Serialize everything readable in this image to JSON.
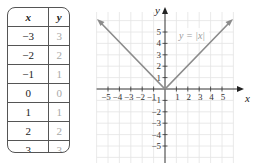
{
  "table": {
    "headers": [
      "x",
      "y"
    ],
    "rows": [
      {
        "x": "−3",
        "y": "3"
      },
      {
        "x": "−2",
        "y": "2"
      },
      {
        "x": "−1",
        "y": "1"
      },
      {
        "x": "0",
        "y": "0"
      },
      {
        "x": "1",
        "y": "1"
      },
      {
        "x": "2",
        "y": "2"
      },
      {
        "x": "3",
        "y": "3"
      }
    ]
  },
  "graph": {
    "function_label": "y = |x|",
    "x_axis_label": "x",
    "y_axis_label": "y",
    "x_ticks": [
      "−5",
      "−4",
      "−3",
      "−2",
      "−1",
      "1",
      "2",
      "3",
      "4",
      "5"
    ],
    "y_ticks": [
      "5",
      "4",
      "3",
      "2",
      "1",
      "−1",
      "−2",
      "−3",
      "−4",
      "−5"
    ],
    "line_color": "#8c8c8c",
    "grid_color": "#e4e4e4",
    "axis_color": "#333333"
  }
}
